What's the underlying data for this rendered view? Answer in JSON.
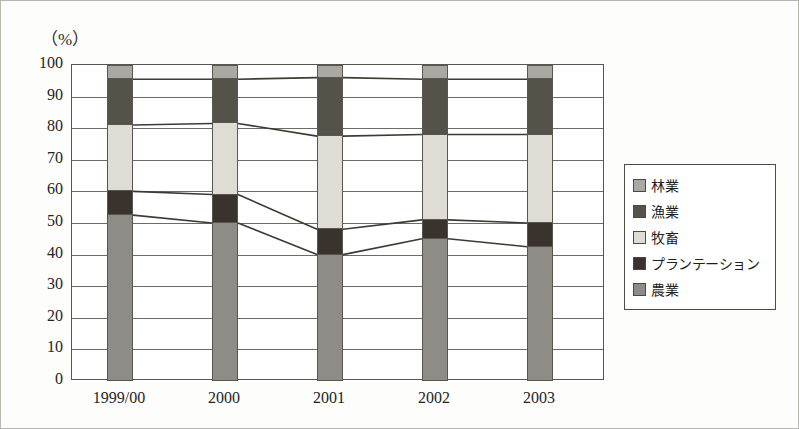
{
  "unit_label": "（%）",
  "legend": {
    "items": [
      {
        "label": "林業",
        "color": "#a9a8a2"
      },
      {
        "label": "漁業",
        "color": "#55524a"
      },
      {
        "label": "牧畜",
        "color": "#dedcd4"
      },
      {
        "label": "プランテーション",
        "color": "#3a322c"
      },
      {
        "label": "農業",
        "color": "#8d8c86"
      }
    ]
  },
  "chart_data": {
    "type": "bar",
    "title": "",
    "xlabel": "",
    "ylabel": "（%）",
    "ylim": [
      0,
      100
    ],
    "ytick_step": 10,
    "yticks": [
      100,
      90,
      80,
      70,
      60,
      50,
      40,
      30,
      20,
      10,
      0
    ],
    "grid": true,
    "stacked": true,
    "legend_position": "right",
    "categories": [
      "1999/00",
      "2000",
      "2001",
      "2002",
      "2003"
    ],
    "series": [
      {
        "name": "農業",
        "color": "#8d8c86",
        "values": [
          52.5,
          50.0,
          40.0,
          45.0,
          42.5
        ]
      },
      {
        "name": "プランテーション",
        "color": "#3a322c",
        "values": [
          7.5,
          9.0,
          8.0,
          6.0,
          7.5
        ]
      },
      {
        "name": "牧畜",
        "color": "#dedcd4",
        "values": [
          21.0,
          22.5,
          29.5,
          27.0,
          28.0
        ]
      },
      {
        "name": "漁業",
        "color": "#55524a",
        "values": [
          14.5,
          14.0,
          18.5,
          17.5,
          17.5
        ]
      },
      {
        "name": "林業",
        "color": "#a9a8a2",
        "values": [
          4.5,
          4.5,
          4.0,
          4.5,
          4.5
        ]
      }
    ],
    "cumulative_tops": [
      [
        52.5,
        60.0,
        81.0,
        95.5,
        100.0
      ],
      [
        50.0,
        59.0,
        81.5,
        95.5,
        100.0
      ],
      [
        40.0,
        48.0,
        77.5,
        96.0,
        100.0
      ],
      [
        45.0,
        51.0,
        78.0,
        95.5,
        100.0
      ],
      [
        42.5,
        50.0,
        78.0,
        95.5,
        100.0
      ]
    ]
  }
}
